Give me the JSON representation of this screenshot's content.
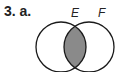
{
  "problem": {
    "label": "3. a."
  },
  "venn": {
    "sets": [
      {
        "name": "E",
        "cx": 61,
        "cy": 47,
        "r": 25
      },
      {
        "name": "F",
        "cx": 89,
        "cy": 47,
        "r": 25
      }
    ],
    "shaded_region": "E ∩ F",
    "colors": {
      "shade": "#8a8a8a",
      "stroke": "#1a1a1a",
      "background": "#ffffff"
    }
  }
}
